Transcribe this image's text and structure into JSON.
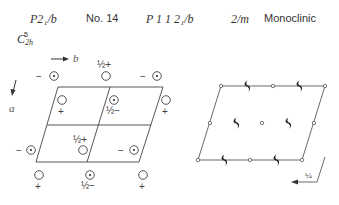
{
  "header": {
    "short_symbol": "P2₁/b",
    "number": "No. 14",
    "full_symbol": "P 1 1 2₁/b",
    "point_group": "2/m",
    "crystal_system": "Monoclinic",
    "schoenflies": {
      "base": "C",
      "sub": "2h",
      "sup": "5"
    }
  },
  "left_diagram": {
    "axis_b_label": "b",
    "axis_a_label": "a",
    "positions": [
      {
        "sign": "−",
        "marked": true,
        "frac": ""
      },
      {
        "sign": "+",
        "marked": false,
        "frac": "½"
      },
      {
        "sign": "−",
        "marked": true,
        "frac": ""
      },
      {
        "sign": "+",
        "marked": false,
        "frac": ""
      },
      {
        "sign": "−",
        "marked": true,
        "frac": "½"
      },
      {
        "sign": "+",
        "marked": false,
        "frac": ""
      },
      {
        "sign": "+",
        "marked": false,
        "frac": "½"
      },
      {
        "sign": "−",
        "marked": true,
        "frac": ""
      },
      {
        "sign": "−",
        "marked": true,
        "frac": ""
      },
      {
        "sign": "+",
        "marked": false,
        "frac": ""
      },
      {
        "sign": "−",
        "marked": true,
        "frac": "½"
      },
      {
        "sign": "+",
        "marked": false,
        "frac": ""
      }
    ],
    "labels": {
      "half_plus": "½+",
      "half_minus": "½−",
      "plus": "+",
      "minus": "−"
    }
  },
  "right_diagram": {
    "glide_height_label": "¼",
    "symbols": [
      "inversion-center",
      "twofold-screw-axis"
    ]
  },
  "colors": {
    "ink": "#333333",
    "background": "#ffffff"
  }
}
